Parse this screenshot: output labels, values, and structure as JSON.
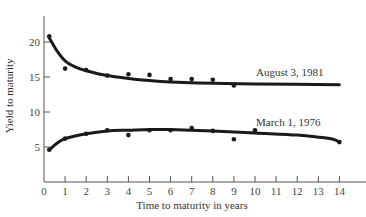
{
  "chart_data": {
    "type": "line",
    "title": "",
    "xlabel": "Time to maturity in years",
    "ylabel": "Yield to maturity",
    "xlim": [
      0,
      14
    ],
    "ylim": [
      0,
      22
    ],
    "xticks": [
      0,
      1,
      2,
      3,
      4,
      5,
      6,
      7,
      8,
      9,
      10,
      11,
      12,
      13,
      14
    ],
    "yticks": [
      5,
      10,
      15,
      20
    ],
    "grid": false,
    "legend": "inline labels",
    "series": [
      {
        "name": "August 3, 1981",
        "points": [
          {
            "x": 0.25,
            "y": 20.8
          },
          {
            "x": 1,
            "y": 16.2
          },
          {
            "x": 2,
            "y": 16.0
          },
          {
            "x": 3,
            "y": 15.2
          },
          {
            "x": 4,
            "y": 15.4
          },
          {
            "x": 5,
            "y": 15.3
          },
          {
            "x": 6,
            "y": 14.7
          },
          {
            "x": 7,
            "y": 14.7
          },
          {
            "x": 8,
            "y": 14.6
          },
          {
            "x": 9,
            "y": 13.8
          }
        ],
        "fit_curve": [
          {
            "x": 0.25,
            "y": 20.6
          },
          {
            "x": 0.6,
            "y": 18.8
          },
          {
            "x": 1,
            "y": 17.3
          },
          {
            "x": 1.5,
            "y": 16.4
          },
          {
            "x": 2,
            "y": 15.9
          },
          {
            "x": 3,
            "y": 15.2
          },
          {
            "x": 4,
            "y": 14.8
          },
          {
            "x": 5,
            "y": 14.5
          },
          {
            "x": 6,
            "y": 14.3
          },
          {
            "x": 8,
            "y": 14.1
          },
          {
            "x": 10,
            "y": 14.0
          },
          {
            "x": 14,
            "y": 13.9
          }
        ]
      },
      {
        "name": "March 1, 1976",
        "points": [
          {
            "x": 0.25,
            "y": 4.6
          },
          {
            "x": 1,
            "y": 6.2
          },
          {
            "x": 2,
            "y": 6.9
          },
          {
            "x": 3,
            "y": 7.4
          },
          {
            "x": 4,
            "y": 6.7
          },
          {
            "x": 5,
            "y": 7.4
          },
          {
            "x": 6,
            "y": 7.4
          },
          {
            "x": 7,
            "y": 7.7
          },
          {
            "x": 8,
            "y": 7.3
          },
          {
            "x": 9,
            "y": 6.1
          },
          {
            "x": 10,
            "y": 7.4
          },
          {
            "x": 14,
            "y": 5.7
          }
        ],
        "fit_curve": [
          {
            "x": 0.25,
            "y": 4.6
          },
          {
            "x": 0.6,
            "y": 5.5
          },
          {
            "x": 1,
            "y": 6.2
          },
          {
            "x": 2,
            "y": 6.9
          },
          {
            "x": 3,
            "y": 7.3
          },
          {
            "x": 4,
            "y": 7.4
          },
          {
            "x": 5,
            "y": 7.5
          },
          {
            "x": 6,
            "y": 7.5
          },
          {
            "x": 7,
            "y": 7.4
          },
          {
            "x": 8,
            "y": 7.3
          },
          {
            "x": 10,
            "y": 7.0
          },
          {
            "x": 12,
            "y": 6.7
          },
          {
            "x": 13,
            "y": 6.4
          },
          {
            "x": 13.7,
            "y": 6.1
          },
          {
            "x": 14,
            "y": 5.7
          }
        ]
      }
    ],
    "annotations": [
      {
        "text": "August 3, 1981",
        "x": 10.5,
        "y": 15.2
      },
      {
        "text": "March 1, 1976",
        "x": 10.5,
        "y": 8.4
      }
    ]
  },
  "labels": {
    "xlabel": "Time to maturity in years",
    "ylabel": "Yield to maturity",
    "series_aug": "August 3, 1981",
    "series_mar": "March 1, 1976"
  },
  "style": {
    "ink": "#1a1a1a",
    "axis": "#555555"
  }
}
